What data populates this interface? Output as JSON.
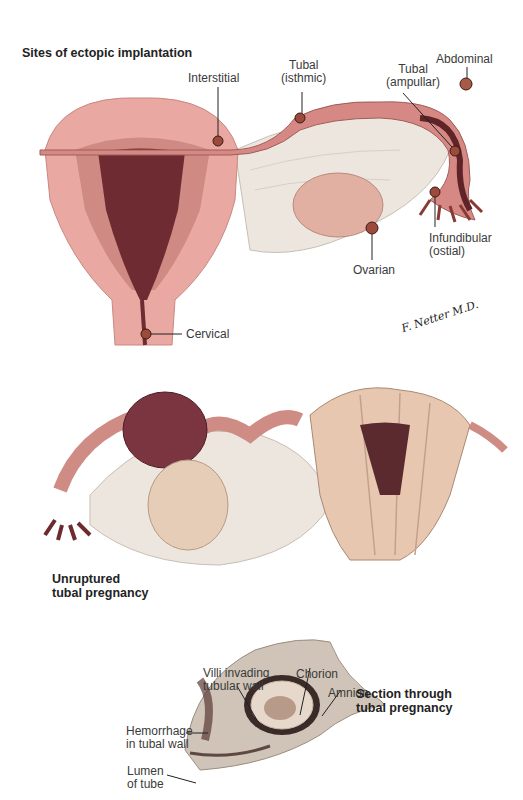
{
  "figure": {
    "panel_top": {
      "title": "Sites of ectopic implantation",
      "labels": {
        "interstitial": "Interstitial",
        "tubal_isthmic": "Tubal\n(isthmic)",
        "tubal_ampullar": "Tubal\n(ampullar)",
        "abdominal": "Abdominal",
        "infundibular": "Infundibular\n(ostial)",
        "ovarian": "Ovarian",
        "cervical": "Cervical"
      },
      "signature": "F. Netter M.D."
    },
    "panel_middle": {
      "caption": "Unruptured\ntubal pregnancy"
    },
    "panel_bottom": {
      "caption": "Section through\ntubal pregnancy",
      "labels": {
        "villi": "Villi invading\ntubular wall",
        "chorion": "Chorion",
        "amnion": "Amnion",
        "hemorrhage": "Hemorrhage\nin tubal wall",
        "lumen": "Lumen\nof tube"
      }
    }
  },
  "colors": {
    "myometrium": "#e8a7a0",
    "endometrium": "#c87a75",
    "cavity": "#6b2a30",
    "tube": "#d98c86",
    "ligament": "#eae3dc",
    "ovary": "#e3b0a2",
    "implant": "#8a3a2e"
  }
}
